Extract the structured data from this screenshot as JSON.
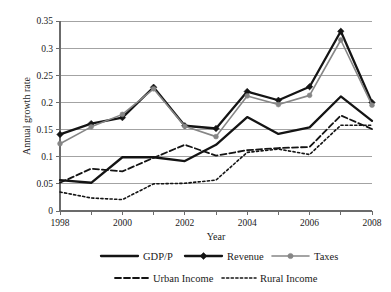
{
  "chart_data": {
    "type": "line",
    "title": "",
    "xlabel": "Year",
    "ylabel": "Annual growth rate",
    "grid": true,
    "legend_position": "bottom",
    "xlim": [
      1998,
      2008
    ],
    "ylim": [
      0,
      0.35
    ],
    "x": [
      1998,
      1999,
      2000,
      2001,
      2002,
      2003,
      2004,
      2005,
      2006,
      2007,
      2008
    ],
    "xtick_labels": [
      "1998",
      "2000",
      "2002",
      "2004",
      "2006",
      "2008"
    ],
    "xticks": [
      1998,
      2000,
      2002,
      2004,
      2006,
      2008
    ],
    "ytick_labels": [
      "0",
      "0.05",
      "0.1",
      "0.15",
      "0.2",
      "0.25",
      "0.3",
      "0.35"
    ],
    "yticks": [
      0,
      0.05,
      0.1,
      0.15,
      0.2,
      0.25,
      0.3,
      0.35
    ],
    "series": [
      {
        "name": "GDP/P",
        "color": "#141414",
        "style": "solid",
        "marker": "none",
        "width": 2.3,
        "values": [
          0.057,
          0.052,
          0.099,
          0.099,
          0.092,
          0.122,
          0.173,
          0.142,
          0.154,
          0.211,
          0.166
        ]
      },
      {
        "name": "Revenue",
        "color": "#141414",
        "style": "solid",
        "marker": "diamond",
        "width": 2.3,
        "values": [
          0.141,
          0.161,
          0.172,
          0.228,
          0.157,
          0.152,
          0.22,
          0.204,
          0.229,
          0.331,
          0.2
        ]
      },
      {
        "name": "Taxes",
        "color": "#868686",
        "style": "solid",
        "marker": "circle",
        "width": 1.6,
        "values": [
          0.124,
          0.155,
          0.178,
          0.225,
          0.156,
          0.137,
          0.212,
          0.196,
          0.213,
          0.315,
          0.195
        ]
      },
      {
        "name": "Urban Income",
        "color": "#141414",
        "style": "dashed",
        "marker": "none",
        "width": 1.8,
        "values": [
          0.052,
          0.078,
          0.073,
          0.098,
          0.122,
          0.102,
          0.112,
          0.116,
          0.118,
          0.176,
          0.151
        ]
      },
      {
        "name": "Rural Income",
        "color": "#141414",
        "style": "dotted",
        "marker": "none",
        "width": 1.6,
        "values": [
          0.035,
          0.024,
          0.021,
          0.05,
          0.051,
          0.057,
          0.108,
          0.114,
          0.104,
          0.158,
          0.158
        ]
      }
    ]
  },
  "legend": {
    "row1": [
      {
        "label": "GDP/P"
      },
      {
        "label": "Revenue"
      },
      {
        "label": "Taxes"
      }
    ],
    "row2": [
      {
        "label": "Urban Income"
      },
      {
        "label": "Rural Income"
      }
    ]
  }
}
